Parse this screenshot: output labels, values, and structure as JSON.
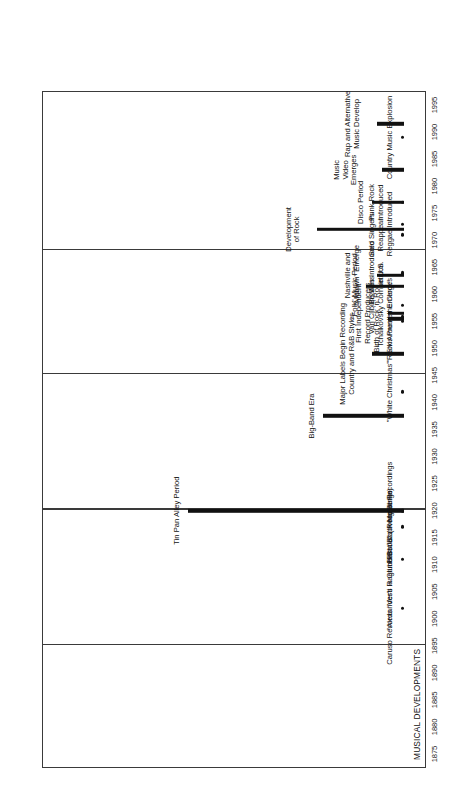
{
  "figure": {
    "section_title": "MUSICAL DEVELOPMENTS",
    "orientation": "rotated-90-ccw"
  },
  "chart_data": {
    "type": "timeline",
    "title": "MUSICAL DEVELOPMENTS",
    "xlabel": "",
    "ylabel": "",
    "xlim": [
      1875,
      1995
    ],
    "tick_step": 5,
    "grid": false,
    "legend": "none",
    "tick_labels": [
      "1875",
      "1880",
      "1885",
      "1890",
      "1895",
      "1900",
      "1905",
      "1910",
      "1915",
      "1920",
      "1925",
      "1930",
      "1935",
      "1940",
      "1945",
      "1950",
      "1955",
      "1960",
      "1965",
      "1970",
      "1975",
      "1980",
      "1985",
      "1990",
      "1995"
    ],
    "section_dividers": [
      1895,
      1920,
      1945,
      1968
    ],
    "events": [
      {
        "label": "Caruso Records \"Vesti la Giubba\"",
        "marker": "dot",
        "start": 1902,
        "end": 1902
      },
      {
        "label": "\"Alexander's Ragtime Band\" (Irving Berlin)",
        "marker": "dot",
        "start": 1911,
        "end": 1911
      },
      {
        "label": "First Jazz Recordings",
        "marker": "dot",
        "start": 1917,
        "end": 1917
      },
      {
        "label": "First Black Music Recordings",
        "marker": "dot",
        "start": 1920,
        "end": 1920
      },
      {
        "label": "Tin Pan Alley Period",
        "marker": "bar",
        "start": 1900,
        "end": 1940
      },
      {
        "label": "Big-Band Era",
        "marker": "bar",
        "start": 1930,
        "end": 1945
      },
      {
        "label": "\"White Christmas\"",
        "marker": "dot",
        "start": 1942,
        "end": 1942
      },
      {
        "label": "Major Labels Begin Recording\nCountry and R&B Styles",
        "marker": "bar",
        "start": 1946,
        "end": 1952
      },
      {
        "label": "Birth of Rock 'n' Roll",
        "marker": "bar",
        "start": 1954,
        "end": 1957
      },
      {
        "label": "First Independent\nRecord Producers",
        "marker": "bar",
        "start": 1955,
        "end": 1958
      },
      {
        "label": "\"Rock Around the Clock\"",
        "marker": "dot",
        "start": 1955,
        "end": 1955
      },
      {
        "label": "Elvis Presley Emerges",
        "marker": "dot",
        "start": 1956,
        "end": 1956
      },
      {
        "label": "Van Cliburn Wins\nTchaikovsky Competition",
        "marker": "dot",
        "start": 1958,
        "end": 1958
      },
      {
        "label": "\"Folk\" Music Period",
        "marker": "bar",
        "start": 1958,
        "end": 1965
      },
      {
        "label": "Nashville and\n\"Motown\" Emerge",
        "marker": "bar",
        "start": 1961,
        "end": 1966
      },
      {
        "label": "Beatles Introduced\nin U.S.",
        "marker": "dot",
        "start": 1964,
        "end": 1964
      },
      {
        "label": "Development\nof Rock",
        "marker": "bar",
        "start": 1964,
        "end": 1980
      },
      {
        "label": "Solo Singers\nReappear",
        "marker": "dot",
        "start": 1971,
        "end": 1971
      },
      {
        "label": "Reggae Introduced",
        "marker": "dot",
        "start": 1973,
        "end": 1973
      },
      {
        "label": "Disco Period",
        "marker": "bar",
        "start": 1974,
        "end": 1980
      },
      {
        "label": "Punk Rock\nIntroduced",
        "marker": "dot",
        "start": 1977,
        "end": 1977
      },
      {
        "label": "Music\nVideo\nEmerges",
        "marker": "bar",
        "start": 1981,
        "end": 1985
      },
      {
        "label": "Country Music Explosion",
        "marker": "dot",
        "start": 1989,
        "end": 1989
      },
      {
        "label": "Rap and Alternative\nMusic Develop",
        "marker": "bar",
        "start": 1989,
        "end": 1994
      }
    ]
  }
}
